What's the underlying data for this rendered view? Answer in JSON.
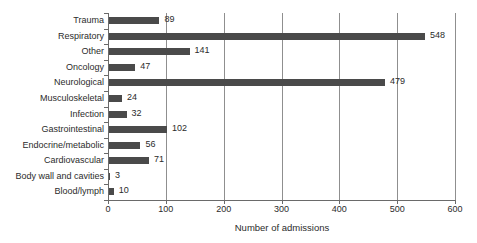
{
  "chart_data": {
    "type": "bar",
    "orientation": "horizontal",
    "title": "",
    "xlabel": "Number of admissions",
    "ylabel": "",
    "xlim": [
      0,
      600
    ],
    "xticks": [
      0,
      100,
      200,
      300,
      400,
      500,
      600
    ],
    "grid": "vertical",
    "legend": null,
    "bar_color": "#4a4a4a",
    "categories": [
      "Trauma",
      "Respiratory",
      "Other",
      "Oncology",
      "Neurological",
      "Musculoskeletal",
      "Infection",
      "Gastrointestinal",
      "Endocrine/metabolic",
      "Cardiovascular",
      "Body wall and cavities",
      "Blood/lymph"
    ],
    "values": [
      89,
      548,
      141,
      47,
      479,
      24,
      32,
      102,
      56,
      71,
      3,
      10
    ],
    "value_labels": [
      "89",
      "548",
      "141",
      "47",
      "479",
      "24",
      "32",
      "102",
      "56",
      "71",
      "3",
      "10"
    ]
  }
}
